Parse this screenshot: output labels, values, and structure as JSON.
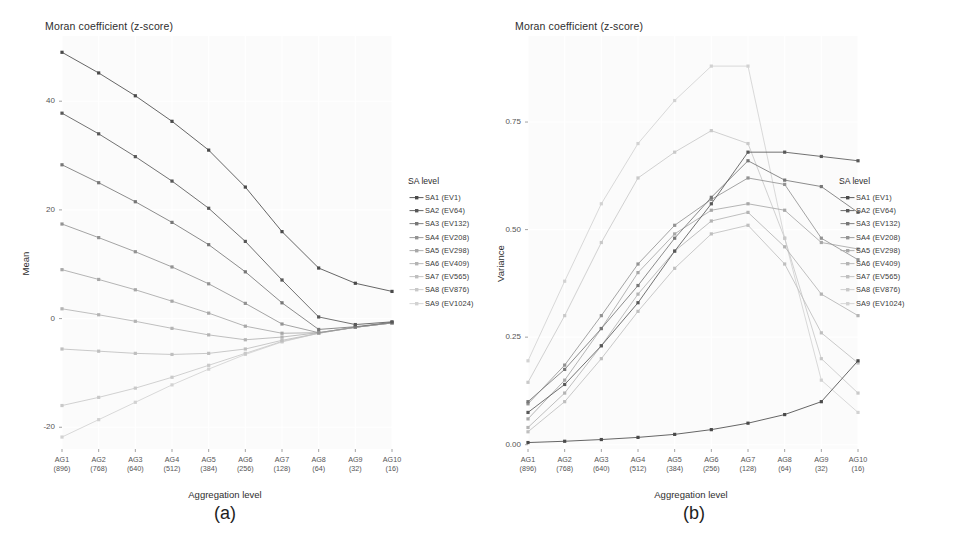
{
  "figure": {
    "panels": [
      {
        "letter": "(a)",
        "title": "Moran coefficient (z-score)",
        "ylabel": "Mean",
        "xlabel": "Aggregation level"
      },
      {
        "letter": "(b)",
        "title": "Moran coefficient (z-score)",
        "ylabel": "Variance",
        "xlabel": "Aggregation level"
      }
    ],
    "legend": {
      "title": "SA level",
      "items": [
        {
          "label": "SA1 (EV1)",
          "color": "#4a4a4a"
        },
        {
          "label": "SA2 (EV64)",
          "color": "#585858"
        },
        {
          "label": "SA3 (EV132)",
          "color": "#777777"
        },
        {
          "label": "SA4 (EV208)",
          "color": "#939393"
        },
        {
          "label": "SA5 (EV298)",
          "color": "#a8a8a8"
        },
        {
          "label": "SA6 (EV409)",
          "color": "#b4b4b4"
        },
        {
          "label": "SA7 (EV565)",
          "color": "#bfbfbf"
        },
        {
          "label": "SA8 (EV876)",
          "color": "#c9c9c9"
        },
        {
          "label": "SA9 (EV1024)",
          "color": "#d2d2d2"
        }
      ]
    }
  },
  "chart_data": [
    {
      "type": "line",
      "title": "Moran coefficient (z-score)",
      "panel": "(a)",
      "xlabel": "Aggregation level",
      "ylabel": "Mean",
      "categories": [
        "AG1",
        "AG2",
        "AG3",
        "AG4",
        "AG5",
        "AG6",
        "AG7",
        "AG8",
        "AG9",
        "AG10"
      ],
      "category_sublabels": [
        "(896)",
        "(768)",
        "(640)",
        "(512)",
        "(384)",
        "(256)",
        "(128)",
        "(64)",
        "(32)",
        "(16)"
      ],
      "ytick_labels": [
        "40",
        "20",
        "0",
        "-20"
      ],
      "ytick_values": [
        40,
        20,
        0,
        -20
      ],
      "ylim": [
        -24,
        52
      ],
      "grid": true,
      "legend_position": "right",
      "series": [
        {
          "name": "SA1 (EV1)",
          "color": "#4a4a4a",
          "values": [
            49.0,
            45.2,
            41.0,
            36.3,
            31.0,
            24.2,
            16.0,
            9.3,
            6.5,
            5.0
          ]
        },
        {
          "name": "SA2 (EV64)",
          "color": "#585858",
          "values": [
            37.8,
            34.0,
            29.8,
            25.3,
            20.3,
            14.2,
            7.1,
            0.3,
            -1.1,
            -0.6
          ]
        },
        {
          "name": "SA3 (EV132)",
          "color": "#777777",
          "values": [
            28.3,
            25.0,
            21.5,
            17.7,
            13.6,
            8.6,
            2.9,
            -2.0,
            -1.5,
            -0.7
          ]
        },
        {
          "name": "SA4 (EV208)",
          "color": "#939393",
          "values": [
            17.4,
            14.9,
            12.3,
            9.5,
            6.4,
            2.8,
            -1.0,
            -2.6,
            -1.6,
            -0.8
          ]
        },
        {
          "name": "SA5 (EV298)",
          "color": "#a8a8a8",
          "values": [
            9.0,
            7.2,
            5.3,
            3.2,
            1.0,
            -1.4,
            -2.7,
            -2.6,
            -1.6,
            -0.8
          ]
        },
        {
          "name": "SA6 (EV409)",
          "color": "#b4b4b4",
          "values": [
            1.8,
            0.7,
            -0.5,
            -1.8,
            -3.0,
            -3.9,
            -3.4,
            -2.6,
            -1.6,
            -0.8
          ]
        },
        {
          "name": "SA7 (EV565)",
          "color": "#bfbfbf",
          "values": [
            -5.6,
            -6.0,
            -6.4,
            -6.6,
            -6.4,
            -5.6,
            -4.0,
            -2.7,
            -1.6,
            -0.8
          ]
        },
        {
          "name": "SA8 (EV876)",
          "color": "#c9c9c9",
          "values": [
            -16.0,
            -14.5,
            -12.8,
            -10.8,
            -8.6,
            -6.4,
            -4.2,
            -2.7,
            -1.6,
            -0.8
          ]
        },
        {
          "name": "SA9 (EV1024)",
          "color": "#d2d2d2",
          "values": [
            -21.8,
            -18.6,
            -15.4,
            -12.2,
            -9.3,
            -6.6,
            -4.3,
            -2.7,
            -1.6,
            -0.8
          ]
        }
      ]
    },
    {
      "type": "line",
      "title": "Moran coefficient (z-score)",
      "panel": "(b)",
      "xlabel": "Aggregation level",
      "ylabel": "Variance",
      "categories": [
        "AG1",
        "AG2",
        "AG3",
        "AG4",
        "AG5",
        "AG6",
        "AG7",
        "AG8",
        "AG9",
        "AG10"
      ],
      "category_sublabels": [
        "(896)",
        "(768)",
        "(640)",
        "(512)",
        "(384)",
        "(256)",
        "(128)",
        "(64)",
        "(32)",
        "(16)"
      ],
      "ytick_labels": [
        "0.00",
        "0.25",
        "0.50",
        "0.75"
      ],
      "ytick_values": [
        0.0,
        0.25,
        0.5,
        0.75
      ],
      "ylim": [
        -0.01,
        0.95
      ],
      "grid": true,
      "legend_position": "right",
      "series": [
        {
          "name": "SA1 (EV1)",
          "color": "#4a4a4a",
          "values": [
            0.005,
            0.008,
            0.012,
            0.017,
            0.024,
            0.035,
            0.05,
            0.07,
            0.1,
            0.195
          ]
        },
        {
          "name": "SA2 (EV64)",
          "color": "#585858",
          "values": [
            0.075,
            0.14,
            0.23,
            0.33,
            0.45,
            0.56,
            0.68,
            0.68,
            0.67,
            0.66
          ]
        },
        {
          "name": "SA3 (EV132)",
          "color": "#777777",
          "values": [
            0.1,
            0.175,
            0.27,
            0.37,
            0.48,
            0.575,
            0.66,
            0.615,
            0.6,
            0.54
          ]
        },
        {
          "name": "SA4 (EV208)",
          "color": "#939393",
          "values": [
            0.095,
            0.185,
            0.3,
            0.42,
            0.51,
            0.57,
            0.62,
            0.605,
            0.48,
            0.43
          ]
        },
        {
          "name": "SA5 (EV298)",
          "color": "#a8a8a8",
          "values": [
            0.06,
            0.15,
            0.27,
            0.4,
            0.49,
            0.545,
            0.56,
            0.545,
            0.47,
            0.455
          ]
        },
        {
          "name": "SA6 (EV409)",
          "color": "#b4b4b4",
          "values": [
            0.04,
            0.12,
            0.23,
            0.35,
            0.45,
            0.52,
            0.54,
            0.46,
            0.35,
            0.3
          ]
        },
        {
          "name": "SA7 (EV565)",
          "color": "#bfbfbf",
          "values": [
            0.03,
            0.1,
            0.2,
            0.31,
            0.41,
            0.49,
            0.51,
            0.42,
            0.26,
            0.19
          ]
        },
        {
          "name": "SA8 (EV876)",
          "color": "#c9c9c9",
          "values": [
            0.145,
            0.3,
            0.47,
            0.62,
            0.68,
            0.73,
            0.7,
            0.48,
            0.2,
            0.12
          ]
        },
        {
          "name": "SA9 (EV1024)",
          "color": "#d2d2d2",
          "values": [
            0.195,
            0.38,
            0.56,
            0.7,
            0.8,
            0.88,
            0.88,
            0.48,
            0.15,
            0.075
          ]
        }
      ]
    }
  ]
}
